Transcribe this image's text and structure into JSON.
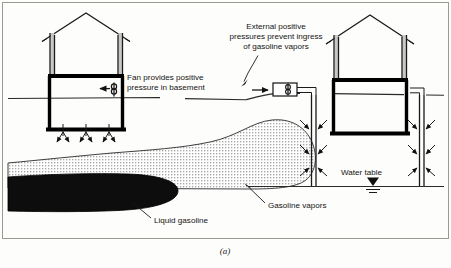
{
  "figure": {
    "caption": "(a)",
    "labels": {
      "fan_line1": "Fan provides positive",
      "fan_line2": "pressure in basement",
      "external_line1": "External positive",
      "external_line2": "pressures prevent ingress",
      "external_line3": "of gasoline vapors",
      "water_table": "Water table",
      "gasoline_vapors": "Gasoline vapors",
      "liquid_gasoline": "Liquid gasoline"
    },
    "elements": {
      "left_house": "house-cross-section-left",
      "right_house": "house-cross-section-right",
      "left_fan": "fan-icon-basement",
      "right_blower": "blower-unit-exterior",
      "injection_well_left": "injection-well-left",
      "injection_well_right": "injection-well-right",
      "water_table_symbol": "water-table-symbol",
      "vapor_plume": "gasoline-vapor-plume",
      "liquid_plume": "liquid-gasoline-pool",
      "ground_surface": "ground-surface-line"
    },
    "colors": {
      "ink": "#111111",
      "liquid_gasoline": "#0d0d0d",
      "vapor_dots": "#2a2a2a",
      "wall_shade": "#c9c9c4",
      "frame": "#9a9a92",
      "background": "#fdfdfb"
    }
  }
}
